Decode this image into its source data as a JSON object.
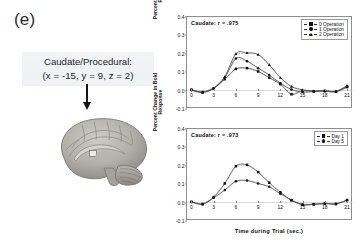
{
  "figure": {
    "panel_letter": "(e)",
    "region_label_line1": "Caudate/Procedural:",
    "region_label_line2": "(x = -15, y = 9, z = 2)",
    "brain_alt": "sagittal-brain-render",
    "arrow_alt": "down-arrow-pointer"
  },
  "chart_data": [
    {
      "id": "top",
      "type": "line",
      "title": "Caudate: r = .975",
      "xlabel": "",
      "ylabel": "Percent Change in Bold\nResponse",
      "x": [
        0,
        1.5,
        3,
        4.5,
        6,
        7.5,
        9,
        10.5,
        12,
        13.5,
        15,
        16.5,
        18,
        19.5,
        21
      ],
      "xticks": [
        0,
        3,
        6,
        9,
        12,
        15,
        18,
        21
      ],
      "yticks": [
        -0.1,
        0.0,
        0.1,
        0.2,
        0.3,
        0.4
      ],
      "xlim": [
        -0.6,
        21.8
      ],
      "ylim": [
        -0.1,
        0.4
      ],
      "grid": false,
      "legend_position": "top-right",
      "series": [
        {
          "name": "0 Operation",
          "marker": "square",
          "values": [
            0.005,
            -0.008,
            0.012,
            0.062,
            0.118,
            0.122,
            0.104,
            0.07,
            0.035,
            -0.02,
            0.0,
            -0.004,
            -0.002,
            -0.005,
            0.024
          ]
        },
        {
          "name": "1 Operation",
          "marker": "circle",
          "values": [
            0.002,
            -0.01,
            0.013,
            0.07,
            0.175,
            0.16,
            0.122,
            0.085,
            0.04,
            0.006,
            -0.008,
            -0.005,
            -0.004,
            -0.006,
            0.018
          ]
        },
        {
          "name": "2 Operation",
          "marker": "triangle",
          "values": [
            0.004,
            -0.009,
            0.014,
            0.075,
            0.2,
            0.205,
            0.196,
            0.14,
            0.07,
            0.022,
            0.004,
            -0.002,
            0.0,
            -0.004,
            0.026
          ]
        }
      ]
    },
    {
      "id": "bottom",
      "type": "line",
      "title": "Caudate: r = .973",
      "xlabel": "Time during Trial (sec.)",
      "ylabel": "Percent Change in Bold\nResponse",
      "x": [
        0,
        1.5,
        3,
        4.5,
        6,
        7.5,
        9,
        10.5,
        12,
        13.5,
        15,
        16.5,
        18,
        19.5,
        21
      ],
      "xticks": [
        0,
        3,
        6,
        9,
        12,
        15,
        18,
        21
      ],
      "yticks": [
        -0.1,
        0.0,
        0.1,
        0.2,
        0.3,
        0.4
      ],
      "xlim": [
        -0.6,
        21.8
      ],
      "ylim": [
        -0.1,
        0.4
      ],
      "grid": false,
      "legend_position": "top-right",
      "series": [
        {
          "name": "Day 1",
          "marker": "square",
          "values": [
            0.004,
            -0.008,
            0.03,
            0.104,
            0.198,
            0.205,
            0.166,
            0.108,
            0.056,
            0.012,
            -0.012,
            -0.01,
            -0.006,
            -0.008,
            0.014
          ]
        },
        {
          "name": "Day 5",
          "marker": "circle",
          "values": [
            0.003,
            -0.009,
            0.026,
            0.068,
            0.116,
            0.12,
            0.104,
            0.086,
            0.048,
            0.014,
            -0.01,
            -0.008,
            -0.004,
            -0.006,
            0.012
          ]
        }
      ]
    }
  ]
}
